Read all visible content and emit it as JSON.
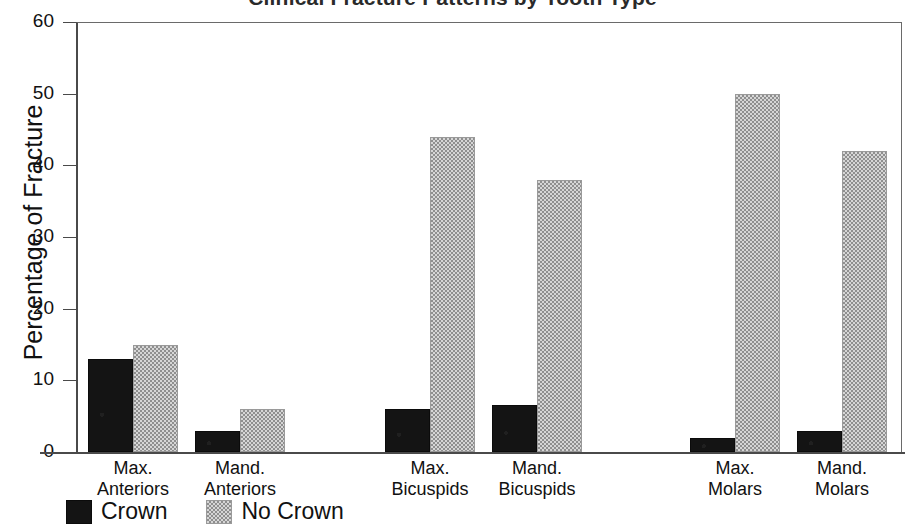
{
  "chart_data": {
    "type": "bar",
    "title": "Clinical Fracture Patterns by Tooth Type",
    "xlabel": "",
    "ylabel": "Percentage of Fracture",
    "ylim": [
      0,
      60
    ],
    "yticks": [
      0,
      10,
      20,
      30,
      40,
      50,
      60
    ],
    "ytick_labels": [
      "0",
      "10",
      "20",
      "30",
      "40",
      "50",
      "60"
    ],
    "grid": false,
    "legend_position": "bottom-left",
    "categories": [
      "Max. Anteriors",
      "Mand. Anteriors",
      "Max. Bicuspids",
      "Mand. Bicuspids",
      "Max. Molars",
      "Mand. Molars"
    ],
    "category_lines": [
      [
        "Max.",
        "Anteriors"
      ],
      [
        "Mand.",
        "Anteriors"
      ],
      [
        "Max.",
        "Bicuspids"
      ],
      [
        "Mand.",
        "Bicuspids"
      ],
      [
        "Max.",
        "Molars"
      ],
      [
        "Mand.",
        "Molars"
      ]
    ],
    "series": [
      {
        "name": "Crown",
        "color": "#141414",
        "values": [
          13,
          3,
          6,
          6.5,
          2,
          3
        ]
      },
      {
        "name": "No Crown",
        "color": "#b9b9b9",
        "values": [
          15,
          6,
          44,
          38,
          50,
          42
        ]
      }
    ]
  },
  "legend": {
    "items": [
      {
        "label": "Crown",
        "swatch": "solid-black-swatch"
      },
      {
        "label": "No Crown",
        "swatch": "gray-dotted-swatch"
      }
    ]
  }
}
